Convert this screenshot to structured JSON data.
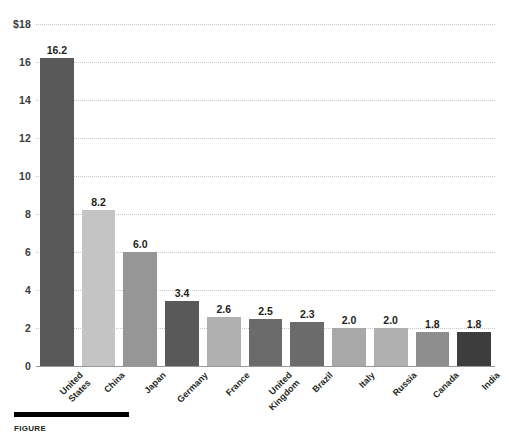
{
  "chart_data": {
    "type": "bar",
    "title": "",
    "subtitle": "",
    "xlabel": "",
    "ylabel": "",
    "ylim": [
      0,
      18
    ],
    "grid": true,
    "legend": "none",
    "orientation": "vertical",
    "value_label_format": "one-decimal",
    "categories": [
      "United\nStates",
      "China",
      "Japan",
      "Germany",
      "France",
      "United\nKingdom",
      "Brazil",
      "Italy",
      "Russia",
      "Canada",
      "India"
    ],
    "values": [
      16.2,
      8.2,
      6.0,
      3.4,
      2.6,
      2.5,
      2.3,
      2.0,
      2.0,
      1.8,
      1.8
    ],
    "value_labels": [
      "16.2",
      "8.2",
      "6.0",
      "3.4",
      "2.6",
      "2.5",
      "2.3",
      "2.0",
      "2.0",
      "1.8",
      "1.8"
    ],
    "bar_colors": [
      "#595959",
      "#c4c4c4",
      "#969696",
      "#595959",
      "#b0b0b0",
      "#6b6b6b",
      "#6b6b6b",
      "#a8a8a8",
      "#b0b0b0",
      "#8e8e8e",
      "#3d3d3d"
    ],
    "y_ticks": [
      {
        "value": 18,
        "label": "$18"
      },
      {
        "value": 16,
        "label": "16"
      },
      {
        "value": 14,
        "label": "14"
      },
      {
        "value": 12,
        "label": "12"
      },
      {
        "value": 10,
        "label": "10"
      },
      {
        "value": 8,
        "label": "8"
      },
      {
        "value": 6,
        "label": "6"
      },
      {
        "value": 4,
        "label": "4"
      },
      {
        "value": 2,
        "label": "2"
      },
      {
        "value": 0,
        "label": "0"
      }
    ]
  },
  "caption": {
    "label": "FIGURE",
    "text": ""
  },
  "colors": {
    "gridline": "#c9c9c9",
    "axis": "#9a9a9a",
    "text": "#231f20",
    "caption_rule": "#000000",
    "background": "#ffffff"
  }
}
